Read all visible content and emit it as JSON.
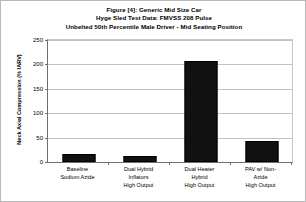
{
  "chart_data": {
    "type": "bar",
    "title": "Figure [4]: Generic Mid Size Car",
    "subtitle": "Hyge Sled Test Data: FMVSS 208 Pulse",
    "subtitle2": "Unbelted 50th Percentile Male Driver - Mid Seating Position",
    "title_lines": [
      "Figure [4]: Generic Mid Size Car",
      "Hyge Sled Test Data: FMVSS 208 Pulse",
      "Unbelted 50th Percentile Male Driver - Mid Seating Position"
    ],
    "xlabel": "",
    "ylabel": "Neck Axial Compression (% IARV)",
    "ylim": [
      0,
      250
    ],
    "yticks": [
      0,
      50,
      100,
      150,
      200,
      250
    ],
    "ytick_labels": [
      "0",
      "50",
      "100",
      "150",
      "200",
      "250"
    ],
    "grid": true,
    "legend": false,
    "bar_color": "#111111",
    "categories": [
      "Baseline Sodium Azide",
      "Dual Hybrid Inflators High Output",
      "Dual Heater Hybrid High Output",
      "PAV w/ Non-Azide High Output"
    ],
    "category_label_lines": [
      [
        "Baseline",
        "Sodium Azide"
      ],
      [
        "Dual Hybrid",
        "Inflators",
        "High Output"
      ],
      [
        "Dual Heater",
        "Hybrid",
        "High Output"
      ],
      [
        "PAV w/ Non-",
        "Azide",
        "High Output"
      ]
    ],
    "values": [
      16,
      12,
      208,
      43
    ]
  }
}
